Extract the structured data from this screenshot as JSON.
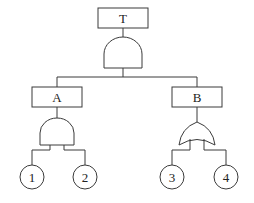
{
  "diagram": {
    "type": "fault-tree",
    "top_event": {
      "label": "T",
      "gate": "AND"
    },
    "intermediate_events": [
      {
        "label": "A",
        "gate": "AND",
        "inputs": [
          "1",
          "2"
        ]
      },
      {
        "label": "B",
        "gate": "OR",
        "inputs": [
          "3",
          "4"
        ]
      }
    ],
    "basic_events": [
      {
        "label": "1"
      },
      {
        "label": "2"
      },
      {
        "label": "3"
      },
      {
        "label": "4"
      }
    ]
  }
}
